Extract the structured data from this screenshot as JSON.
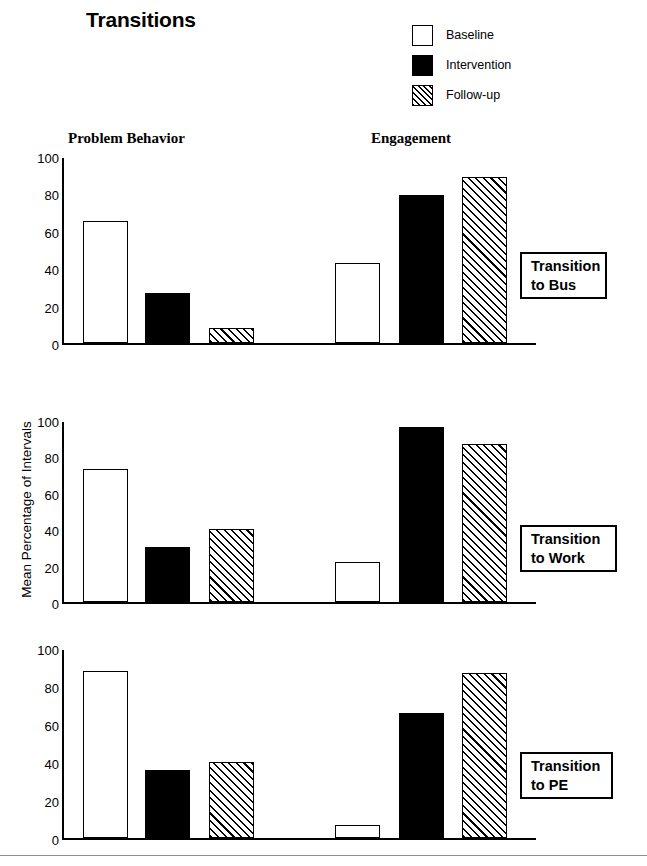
{
  "title": "Transitions",
  "legend": {
    "position": "top-right",
    "items": [
      {
        "label": "Baseline",
        "swatch": "open-square-icon",
        "fill": "white"
      },
      {
        "label": "Intervention",
        "swatch": "filled-square-icon",
        "fill": "black"
      },
      {
        "label": "Follow-up",
        "swatch": "hatched-square-icon",
        "fill": "hatched"
      }
    ]
  },
  "group_headers": {
    "problem_behavior": "Problem Behavior",
    "engagement": "Engagement"
  },
  "y_axis_title": "Mean Percentage of Intervals",
  "tick_labels": [
    "100",
    "80",
    "60",
    "40",
    "20",
    "0"
  ],
  "panels": [
    {
      "condition": "Transition\nto Bus"
    },
    {
      "condition": "Transition\nto Work"
    },
    {
      "condition": "Transition\nto PE"
    }
  ],
  "chart_data": {
    "type": "bar",
    "title": "Transitions",
    "xlabel": "",
    "ylabel": "Mean Percentage of Intervals",
    "ylim": [
      0,
      100
    ],
    "yticks": [
      0,
      20,
      40,
      60,
      80,
      100
    ],
    "grid": false,
    "legend_position": "top-right",
    "categories": [
      "Problem Behavior",
      "Engagement"
    ],
    "series_names": [
      "Baseline",
      "Intervention",
      "Follow-up"
    ],
    "panels": [
      {
        "name": "Transition to Bus",
        "groups": [
          {
            "category": "Problem Behavior",
            "values": [
              65,
              27,
              8
            ]
          },
          {
            "category": "Engagement",
            "values": [
              43,
              79,
              89
            ]
          }
        ]
      },
      {
        "name": "Transition to Work",
        "groups": [
          {
            "category": "Problem Behavior",
            "values": [
              73,
              30,
              40
            ]
          },
          {
            "category": "Engagement",
            "values": [
              22,
              96,
              87
            ]
          }
        ]
      },
      {
        "name": "Transition to PE",
        "groups": [
          {
            "category": "Problem Behavior",
            "values": [
              88,
              36,
              40
            ]
          },
          {
            "category": "Engagement",
            "values": [
              7,
              66,
              87
            ]
          }
        ]
      }
    ]
  },
  "geometry": {
    "plot_left": 62,
    "plot_width": 474,
    "panel_tops": [
      158,
      422,
      650
    ],
    "panel_heights": [
      187,
      182,
      190
    ],
    "bar_width": 45,
    "bar_offsets": [
      19,
      81,
      145,
      271,
      335,
      398
    ],
    "cond_box": [
      {
        "left": 520,
        "top": 252,
        "width": 87,
        "height": 47
      },
      {
        "left": 520,
        "top": 525,
        "width": 97,
        "height": 47
      },
      {
        "left": 520,
        "top": 752,
        "width": 93,
        "height": 47
      }
    ]
  }
}
